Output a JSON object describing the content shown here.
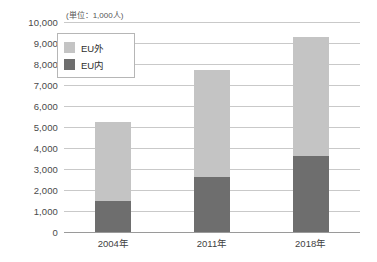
{
  "chart_data": {
    "type": "bar",
    "stacked": true,
    "title": "",
    "subtitle": "",
    "unit_note": "(単位：1,000人)",
    "xlabel": "",
    "ylabel": "",
    "categories": [
      "2004年",
      "2011年",
      "2018年"
    ],
    "ylim": [
      0,
      10000
    ],
    "ytick_step": 1000,
    "ytick_labels": [
      "10,000",
      "9,000",
      "8,000",
      "7,000",
      "6,000",
      "5,000",
      "4,000",
      "3,000",
      "2,000",
      "1,000",
      "0"
    ],
    "ytick_values": [
      10000,
      9000,
      8000,
      7000,
      6000,
      5000,
      4000,
      3000,
      2000,
      1000,
      0
    ],
    "grid": true,
    "legend_position": "upper-left-inside",
    "series": [
      {
        "name": "EU外",
        "color": "#c4c4c4",
        "values": [
          3750,
          5100,
          5700
        ]
      },
      {
        "name": "EU内",
        "color": "#6e6e6e",
        "values": [
          1500,
          2600,
          3600
        ]
      }
    ],
    "totals": [
      5250,
      7700,
      9300
    ]
  },
  "legend": {
    "items": [
      {
        "label": "EU外",
        "color": "#c4c4c4"
      },
      {
        "label": "EU内",
        "color": "#6e6e6e"
      }
    ]
  },
  "colors": {
    "outer": "#c4c4c4",
    "inner": "#6e6e6e",
    "grid": "#c9c9c9",
    "axis": "#9a9a9a",
    "text": "#3f3f3f"
  }
}
